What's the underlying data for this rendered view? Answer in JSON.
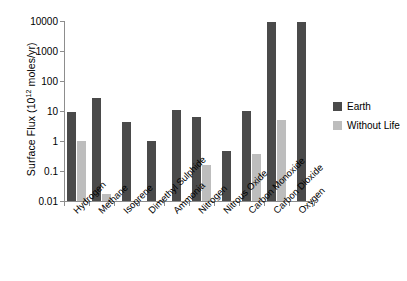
{
  "chart_data": {
    "type": "bar",
    "title": "",
    "xlabel": "",
    "ylabel": "Surface Flux (10¹² moles/yr)",
    "ylabel_base": "Surface Flux (10",
    "ylabel_exp": "12",
    "ylabel_tail": " moles/yr)",
    "yscale": "log",
    "ylim": [
      0.01,
      10000
    ],
    "ytick_labels": [
      "10000",
      "1000",
      "100",
      "10",
      "1",
      "0.1",
      "0.01"
    ],
    "ytick_values": [
      10000,
      1000,
      100,
      10,
      1,
      0.1,
      0.01
    ],
    "grid": false,
    "legend_position": "right",
    "categories": [
      "Hydrogen",
      "Methane",
      "Isoprene",
      "Dimethyl Sulphide",
      "Ammonia",
      "Nitrogen",
      "Nitrous Oxide",
      "Carbon Monoxide",
      "Carbon Dioxide",
      "Oxygen"
    ],
    "series": [
      {
        "name": "Earth",
        "color": "#4a4a4a",
        "values": [
          9.5,
          27,
          4.2,
          1.0,
          11,
          6.2,
          0.47,
          10,
          9000,
          9000
        ]
      },
      {
        "name": "Without Life",
        "color": "#bdbdbd",
        "values": [
          0.97,
          0.017,
          null,
          null,
          null,
          0.155,
          null,
          0.37,
          4.9,
          null
        ]
      }
    ]
  },
  "legend": {
    "items": [
      {
        "label": "Earth",
        "color": "#4a4a4a"
      },
      {
        "label": "Without Life",
        "color": "#bdbdbd"
      }
    ]
  }
}
